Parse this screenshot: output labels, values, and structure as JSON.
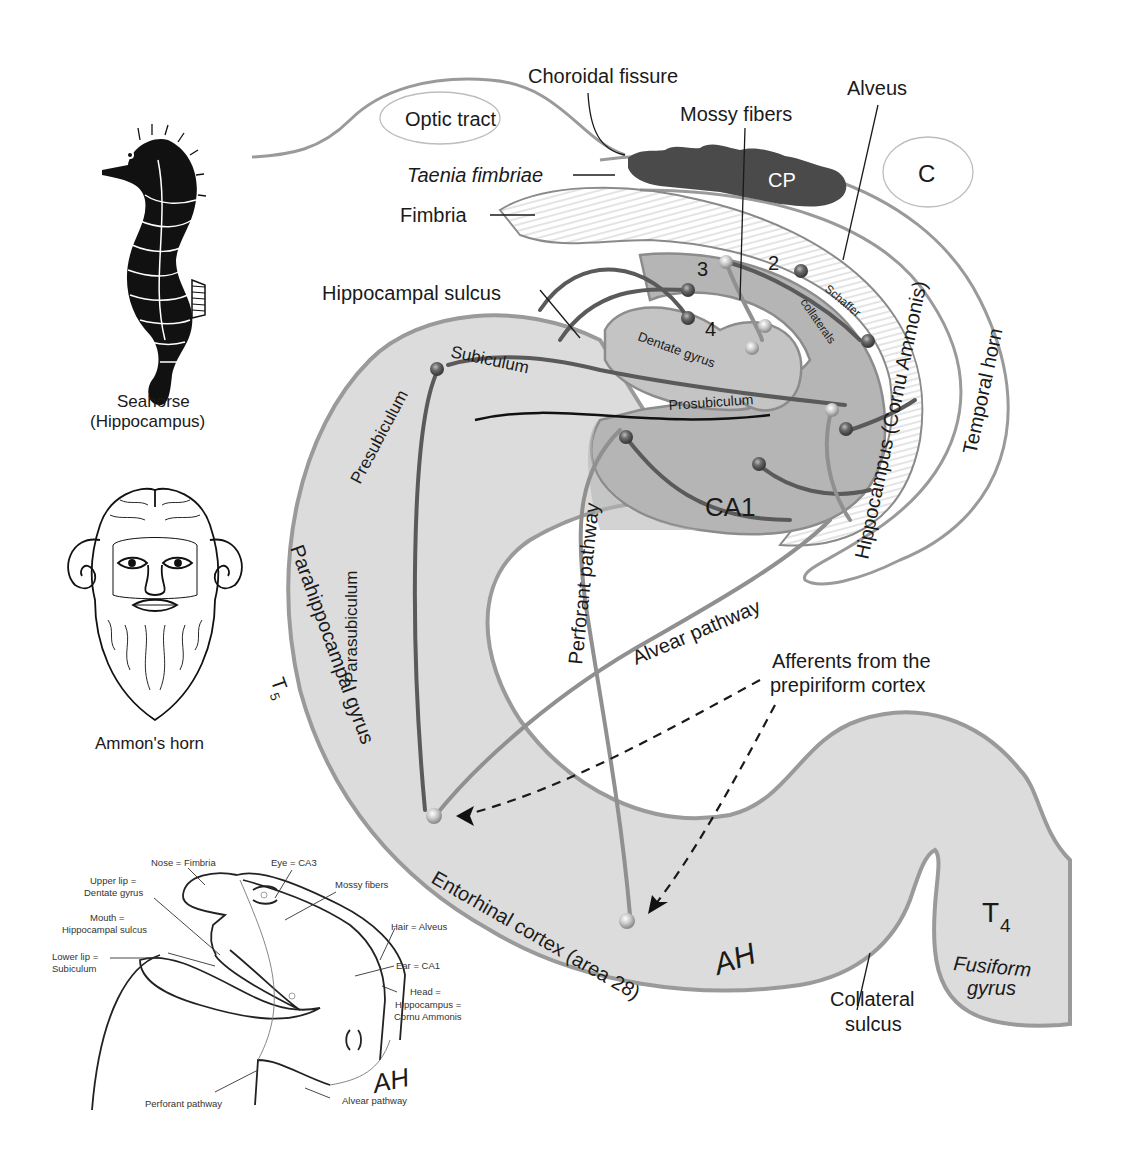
{
  "figure": {
    "colors": {
      "background": "#ffffff",
      "cortex_fill": "#dcdcdc",
      "ammon_fill": "#b5b5b5",
      "dentate_fill": "#c4c4c4",
      "choroid_plexus": "#4a4a4a",
      "outline": "#9a9a9a",
      "axon_dark": "#5a5a5a",
      "text": "#1a1a1a"
    }
  },
  "top_labels": {
    "choroidal_fissure": "Choroidal fissure",
    "optic_tract": "Optic tract",
    "mossy_fibers": "Mossy fibers",
    "alveus": "Alveus",
    "taenia_fimbriae": "Taenia fimbriae",
    "fimbria": "Fimbria",
    "cp": "CP",
    "c": "C",
    "hippocampal_sulcus": "Hippocampal sulcus"
  },
  "structure_labels": {
    "subiculum": "Subiculum",
    "presubiculum": "Presubiculum",
    "parasubiculum": "Parasubiculum",
    "prosubiculum": "Prosubiculum",
    "dentate_gyrus": "Dentate gyrus",
    "schaffer": "Schaffer",
    "collaterals": "collaterals",
    "ca1": "CA1",
    "field_2": "2",
    "field_3": "3",
    "field_4": "4",
    "hippocampus_cornu": "Hippocampus (Cornu Ammonis)",
    "temporal_horn": "Temporal horn",
    "perforant_pathway": "Perforant pathway",
    "alvear_pathway": "Alvear pathway",
    "parahippocampal_gyrus": "Parahippocampal gyrus",
    "t5": "T",
    "t5_sub": "5",
    "afferents_line1": "Afferents from the",
    "afferents_line2": "prepiriform cortex",
    "entorhinal_cortex": "Entorhinal cortex (area 28)",
    "ah_mark": "AH",
    "collateral_line1": "Collateral",
    "collateral_line2": "sulcus",
    "t4": "T",
    "t4_sub": "4",
    "fusiform_line1": "Fusiform",
    "fusiform_line2": "gyrus"
  },
  "insets": {
    "seahorse": {
      "line1": "Seahorse",
      "line2": "(Hippocampus)"
    },
    "ammon": {
      "caption": "Ammon's horn"
    },
    "face_sketch": {
      "nose": "Nose = Fimbria",
      "eye": "Eye = CA3",
      "upper_lip_1": "Upper lip =",
      "upper_lip_2": "Dentate gyrus",
      "mossy": "Mossy fibers",
      "mouth_1": "Mouth =",
      "mouth_2": "Hippocampal sulcus",
      "hair": "Hair = Alveus",
      "lower_lip_1": "Lower lip =",
      "lower_lip_2": "Subiculum",
      "ear": "Ear = CA1",
      "head_1": "Head =",
      "head_2": "Hippocampus =",
      "head_3": "Cornu Ammonis",
      "perforant": "Perforant pathway",
      "alvear": "Alvear pathway",
      "ah": "AH"
    }
  }
}
